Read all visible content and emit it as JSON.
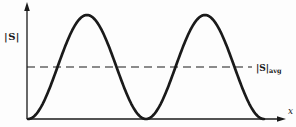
{
  "figure": {
    "background": "#fdfdfd",
    "ink_color": "#1a1a1a"
  },
  "chart_data": {
    "type": "line",
    "title": "",
    "xlabel": "x",
    "ylabel": "|S|",
    "function": "sin^2(pi*x)",
    "x_range": [
      0,
      2
    ],
    "y_range": [
      0,
      1
    ],
    "peak_value": 1,
    "peak_positions": [
      0.5,
      1.5
    ],
    "zero_positions": [
      0,
      1,
      2
    ],
    "average_value": 0.5,
    "average_line_style": "dashed",
    "average_label_main": "|S|",
    "average_label_sub": "avg",
    "grid": false,
    "tick_labels": "none",
    "axis_arrows": true
  }
}
